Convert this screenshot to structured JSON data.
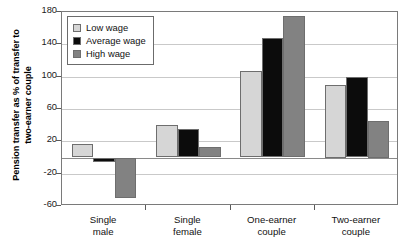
{
  "chart_data": {
    "type": "bar",
    "title": "",
    "xlabel": "",
    "ylabel": "Pension transfer as % of transfer to two-earner couple",
    "ylabel_line1": "Pension transfer as % of transfer to",
    "ylabel_line2": "two-earner couple",
    "ylim": [
      -60,
      180
    ],
    "ytick_values": [
      180,
      140,
      100,
      60,
      20,
      -20,
      -60
    ],
    "ytick_labels": [
      "180",
      "140",
      "100",
      "60",
      "20",
      "-20",
      "-60"
    ],
    "grid": true,
    "legend_position": "top-left",
    "categories": [
      "Single male",
      "Single female",
      "One-earner couple",
      "Two-earner couple"
    ],
    "category_lines": [
      [
        "Single",
        "male"
      ],
      [
        "Single",
        "female"
      ],
      [
        "One-earner",
        "couple"
      ],
      [
        "Two-earner",
        "couple"
      ]
    ],
    "series": [
      {
        "name": "Low wage",
        "color": "#d6d6d6",
        "values": [
          17,
          40,
          107,
          90
        ]
      },
      {
        "name": "Average wage",
        "color": "#0c0c0c",
        "values": [
          -6,
          35,
          148,
          100
        ]
      },
      {
        "name": "High wage",
        "color": "#828282",
        "values": [
          -50,
          13,
          175,
          45
        ]
      }
    ]
  },
  "legend": {
    "items": [
      {
        "label": "Low wage",
        "swatch": "legend-swatch-low-wage"
      },
      {
        "label": "Average wage",
        "swatch": "legend-swatch-average-wage"
      },
      {
        "label": "High wage",
        "swatch": "legend-swatch-high-wage"
      }
    ]
  },
  "colors": {
    "low_wage": "#d6d6d6",
    "average_wage": "#0c0c0c",
    "high_wage": "#828282",
    "gridline": "#c9c9c9",
    "zero_line": "#8a8a8a",
    "frame": "#7a7a7a",
    "bar_outline": "#6e6e6e",
    "background": "#ffffff"
  }
}
